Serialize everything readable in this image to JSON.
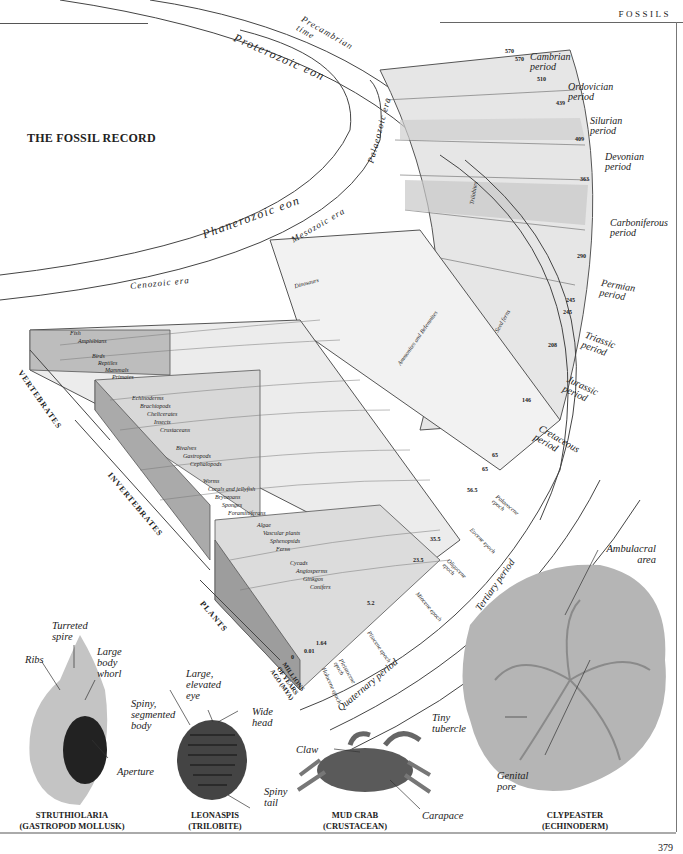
{
  "header": {
    "section_label": "FOSSILS"
  },
  "page_title": "THE FOSSIL RECORD",
  "page_number": "379",
  "eons": [
    {
      "label": "Proterozoic eon"
    },
    {
      "label": "Phanerozoic eon"
    },
    {
      "label": "Precambrian time"
    }
  ],
  "eras": [
    {
      "label": "Palaeozoic era"
    },
    {
      "label": "Mesozoic era"
    },
    {
      "label": "Cenozoic era"
    }
  ],
  "periods": [
    {
      "label": "Cambrian period",
      "start_mya": "570"
    },
    {
      "label": "Ordovician period",
      "start_mya": "510"
    },
    {
      "label": "Silurian period",
      "start_mya": "439"
    },
    {
      "label": "Devonian period",
      "start_mya": "409"
    },
    {
      "label": "Carboniferous period",
      "start_mya": "363"
    },
    {
      "label": "Permian period",
      "start_mya": "290"
    },
    {
      "label": "Triassic period",
      "start_mya": "245"
    },
    {
      "label": "Jurassic period",
      "start_mya": "208"
    },
    {
      "label": "Cretaceous period",
      "start_mya": "146"
    },
    {
      "label": "Tertiary period",
      "start_mya": "65"
    },
    {
      "label": "Quaternary period",
      "start_mya": "1.64"
    }
  ],
  "epochs": [
    {
      "label": "Palaeocene epoch",
      "start_mya": "65"
    },
    {
      "label": "Eocene epoch",
      "start_mya": "56.5"
    },
    {
      "label": "Oligocene epoch",
      "start_mya": "35.5"
    },
    {
      "label": "Miocene epoch",
      "start_mya": "23.5"
    },
    {
      "label": "Pliocene epoch",
      "start_mya": "5.2"
    },
    {
      "label": "Pleistocene epoch",
      "start_mya": "1.64"
    },
    {
      "label": "Holocene epoch",
      "start_mya": "0.01"
    }
  ],
  "tick_labels": [
    "570",
    "570",
    "510",
    "439",
    "409",
    "363",
    "290",
    "245",
    "245",
    "208",
    "146",
    "65",
    "65",
    "56.5",
    "35.5",
    "23.5",
    "5.2",
    "1.64",
    "0.01",
    "0"
  ],
  "axis_label": "MILLIONS OF YEARS AGO (MYA)",
  "groups": [
    {
      "label": "VERTEBRATES",
      "taxa": [
        "Fish",
        "Amphibians",
        "Birds",
        "Reptiles",
        "Mammals",
        "Primates"
      ]
    },
    {
      "label": "INVERTEBRATES",
      "taxa": [
        "Echinoderms",
        "Brachiopods",
        "Chelicerates",
        "Insects",
        "Crustaceans",
        "Bivalves",
        "Gastropods",
        "Cephalopods",
        "Worms",
        "Corals and jellyfish",
        "Bryozoans",
        "Sponges",
        "Foraminiferans"
      ]
    },
    {
      "label": "PLANTS",
      "taxa": [
        "Algae",
        "Vascular plants",
        "Sphenopsids",
        "Ferns",
        "Cycads",
        "Angiosperms",
        "Ginkgos",
        "Conifers"
      ]
    }
  ],
  "band_labels": [
    "Trilobites",
    "Dinosaurs",
    "Ammonites and Belemnites",
    "Seed ferns"
  ],
  "specimens": [
    {
      "name": "STRUTHIOLARIA",
      "type": "(GASTROPOD MOLLUSK)",
      "callouts": [
        "Turreted spire",
        "Ribs",
        "Large body whorl",
        "Aperture"
      ]
    },
    {
      "name": "LEONASPIS",
      "type": "(TRILOBITE)",
      "callouts": [
        "Large, elevated eye",
        "Spiny, segmented body",
        "Wide head",
        "Spiny tail"
      ]
    },
    {
      "name": "MUD CRAB",
      "type": "(CRUSTACEAN)",
      "callouts": [
        "Claw",
        "Carapace"
      ]
    },
    {
      "name": "CLYPEASTER",
      "type": "(ECHINODERM)",
      "callouts": [
        "Ambulacral area",
        "Tiny tubercle",
        "Genital pore"
      ]
    }
  ]
}
